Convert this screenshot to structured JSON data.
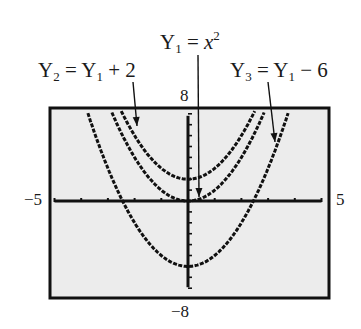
{
  "chart_data": {
    "type": "line",
    "title": "",
    "xlabel": "",
    "ylabel": "",
    "xlim": [
      -5,
      5
    ],
    "ylim": [
      -8,
      8
    ],
    "xscale_ticks": 1,
    "yscale_ticks": 1,
    "grid": false,
    "legend": "annotated labels with pointer lines",
    "window_labels": {
      "ymax": "8",
      "ymin": "−8",
      "xmin": "−5",
      "xmax": "5"
    },
    "series": [
      {
        "name": "Y1 = x^2",
        "label_base": "Y",
        "label_sub": "1",
        "label_rhs_var": "x",
        "label_rhs_sup": "2",
        "shift": 0,
        "vertex": [
          0,
          0
        ]
      },
      {
        "name": "Y2 = Y1 + 2",
        "label_base": "Y",
        "label_sub": "2",
        "label_rhs": "= Y",
        "label_rhs_sub": "1",
        "label_rhs_tail": "+ 2",
        "shift": 2,
        "vertex": [
          0,
          2
        ]
      },
      {
        "name": "Y3 = Y1 − 6",
        "label_base": "Y",
        "label_sub": "3",
        "label_rhs": "= Y",
        "label_rhs_sub": "1",
        "label_rhs_tail": "− 6",
        "shift": -6,
        "vertex": [
          0,
          -6
        ]
      }
    ],
    "sample_points": {
      "x": [
        -4,
        -3,
        -2,
        -1,
        0,
        1,
        2,
        3,
        4
      ],
      "Y1": [
        16,
        9,
        4,
        1,
        0,
        1,
        4,
        9,
        16
      ],
      "Y2": [
        18,
        11,
        6,
        3,
        2,
        3,
        6,
        11,
        18
      ],
      "Y3": [
        10,
        3,
        -2,
        -5,
        -6,
        -5,
        -2,
        3,
        10
      ]
    }
  },
  "colors": {
    "screen_bg": "#ececec",
    "ink": "#111111",
    "page_bg": "#ffffff"
  },
  "labels": {
    "y1": {
      "base": "Y",
      "sub": "1",
      "eq": " = ",
      "var": "x",
      "sup": "2"
    },
    "y2": {
      "base": "Y",
      "sub": "2",
      "eq": " = Y",
      "sub2": "1",
      "tail": " + 2"
    },
    "y3": {
      "base": "Y",
      "sub": "3",
      "eq": " = Y",
      "sub2": "1",
      "tail": " − 6"
    },
    "ymax": "8",
    "ymin": "−8",
    "xmin": "−5",
    "xmax": "5"
  }
}
